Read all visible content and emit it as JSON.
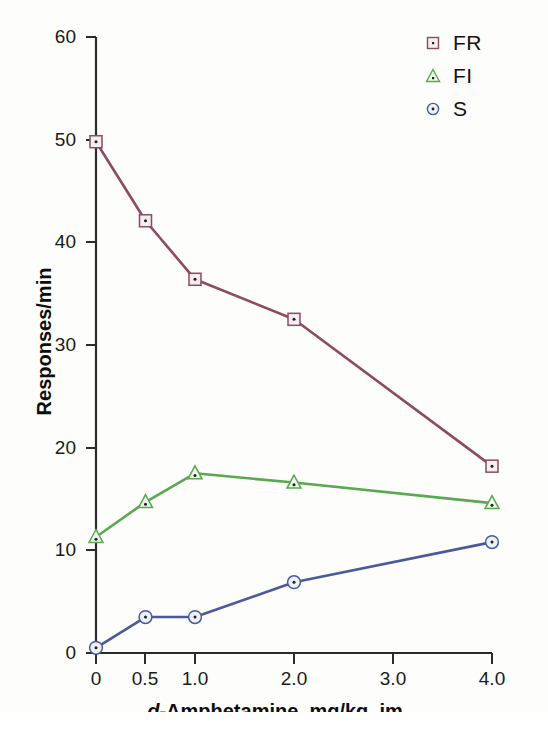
{
  "chart_data": {
    "type": "line",
    "title": "",
    "xlabel": "d-Amphetamine, mg/kg, im",
    "xlabel_italic_prefix": "d",
    "xlabel_rest": "-Amphetamine, mg/kg, im",
    "ylabel": "Responses/min",
    "x": [
      0,
      0.5,
      1.0,
      2.0,
      3.0,
      4.0
    ],
    "x_tick_labels": [
      "0",
      "0.5",
      "1.0",
      "2.0",
      "3.0",
      "4.0"
    ],
    "xlim": [
      0,
      4.0
    ],
    "ylim": [
      0,
      60
    ],
    "y_tick_labels": [
      "0",
      "10",
      "20",
      "30",
      "40",
      "50",
      "60"
    ],
    "y_ticks": [
      0,
      10,
      20,
      30,
      40,
      50,
      60
    ],
    "grid": false,
    "legend_position": "top-right",
    "series": [
      {
        "name": "FR",
        "marker": "square",
        "color": "#8c4a63",
        "marker_fill": "#f4eef0",
        "x": [
          0,
          0.5,
          1.0,
          2.0,
          4.0
        ],
        "values": [
          49.8,
          42.1,
          36.4,
          32.5,
          18.2
        ]
      },
      {
        "name": "FI",
        "marker": "triangle",
        "color": "#5aa84f",
        "marker_fill": "#eef7ec",
        "x": [
          0,
          0.5,
          1.0,
          2.0,
          4.0
        ],
        "values": [
          11.3,
          14.7,
          17.5,
          16.6,
          14.6
        ]
      },
      {
        "name": "S",
        "marker": "circle",
        "color": "#4a5a9c",
        "marker_fill": "#eef0f7",
        "x": [
          0,
          0.5,
          1.0,
          2.0,
          4.0
        ],
        "values": [
          0.5,
          3.5,
          3.5,
          6.9,
          10.8
        ]
      }
    ]
  },
  "axis": {
    "y_labels": [
      "60",
      "50",
      "40",
      "30",
      "20",
      "10",
      "0"
    ],
    "x_labels": [
      "0",
      "0.5",
      "1.0",
      "2.0",
      "3.0",
      "4.0"
    ],
    "y_title": "Responses/min",
    "x_title_italic": "d",
    "x_title_rest": "-Amphetamine, mg/kg, im"
  },
  "legend": {
    "items": [
      {
        "label": "FR",
        "marker": "square-dot-marker"
      },
      {
        "label": "FI",
        "marker": "triangle-dot-marker"
      },
      {
        "label": "S",
        "marker": "circle-dot-marker"
      }
    ]
  },
  "caption": {
    "text": ""
  }
}
